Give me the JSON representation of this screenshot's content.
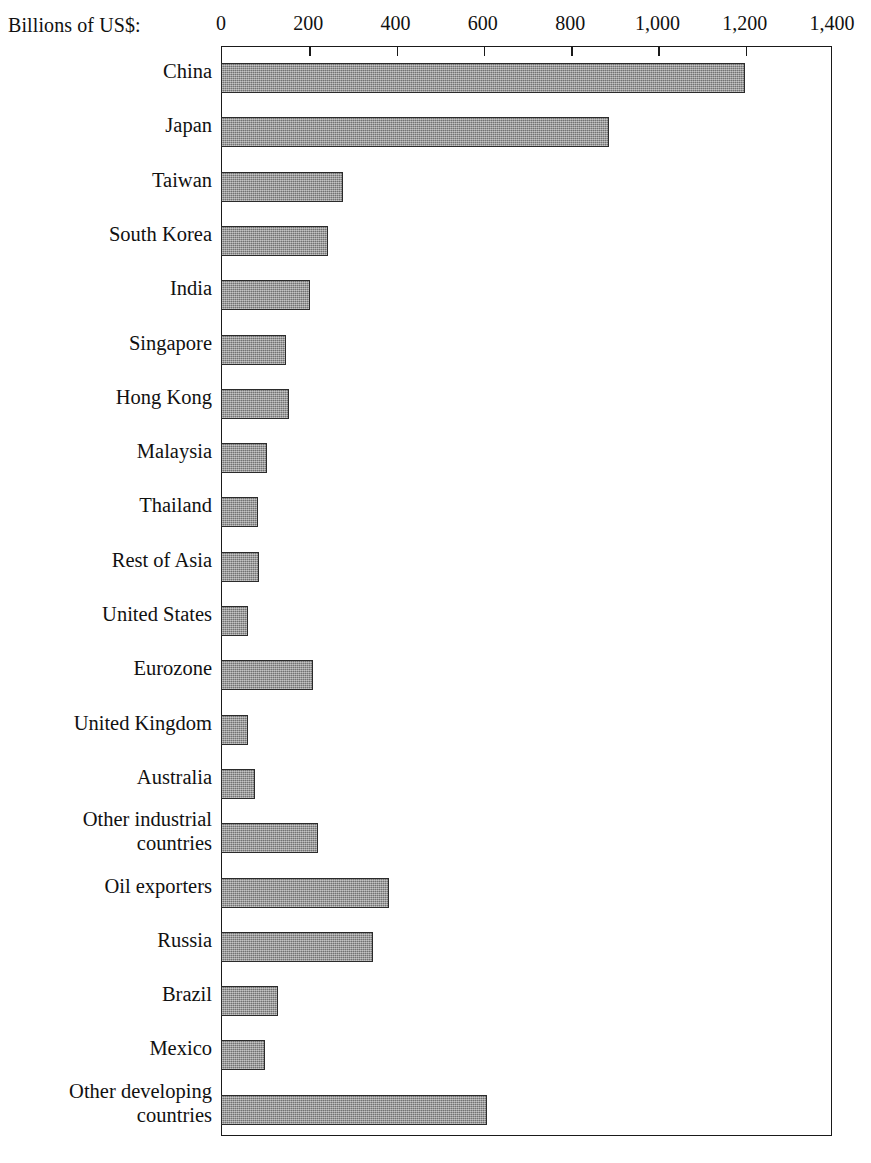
{
  "axis": {
    "unit_label": "Billions of US$:",
    "tick_labels": [
      "0",
      "200",
      "400",
      "600",
      "800",
      "1,000",
      "1,200",
      "1,400"
    ],
    "tick_values": [
      0,
      200,
      400,
      600,
      800,
      1000,
      1200,
      1400
    ]
  },
  "style": {
    "bar_fill": "#8a8a8a",
    "bar_border": "#2b2b2b",
    "frame_color": "#1a1a1a",
    "text_color": "#111111",
    "background": "#ffffff"
  },
  "chart_data": {
    "type": "bar",
    "orientation": "horizontal",
    "title": "",
    "subtitle": "",
    "xlabel": "Billions of US$:",
    "ylabel": "",
    "xlim": [
      0,
      1400
    ],
    "xticks": [
      0,
      200,
      400,
      600,
      800,
      1000,
      1200,
      1400
    ],
    "xtick_labels": [
      "0",
      "200",
      "400",
      "600",
      "800",
      "1,000",
      "1,200",
      "1,400"
    ],
    "grid": false,
    "legend": null,
    "categories": [
      "China",
      "Japan",
      "Taiwan",
      "South Korea",
      "India",
      "Singapore",
      "Hong Kong",
      "Malaysia",
      "Thailand",
      "Rest of Asia",
      "United States",
      "Eurozone",
      "United Kingdom",
      "Australia",
      "Other industrial\ncountries",
      "Oil exporters",
      "Russia",
      "Brazil",
      "Mexico",
      "Other developing\ncountries"
    ],
    "values": [
      1200,
      890,
      280,
      245,
      205,
      150,
      155,
      105,
      85,
      88,
      62,
      210,
      62,
      78,
      222,
      385,
      348,
      131,
      101,
      610
    ]
  }
}
